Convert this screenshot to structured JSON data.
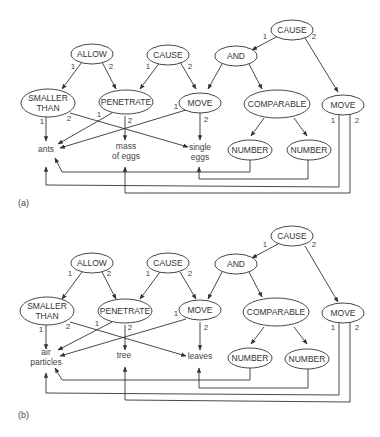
{
  "figure": {
    "panels": [
      {
        "caption": "(a)",
        "nodes": {
          "allow": "ALLOW",
          "cause1": "CAUSE",
          "cause_top": "CAUSE",
          "and": "AND",
          "smaller_than_1": "SMALLER",
          "smaller_than_2": "THAN",
          "penetrate": "PENETRATE",
          "move1": "MOVE",
          "comparable": "COMPARABLE",
          "move2": "MOVE",
          "number1": "NUMBER",
          "number2": "NUMBER"
        },
        "leaves": {
          "leaf1_line1": "ants",
          "leaf1_line2": "",
          "leaf2_line1": "mass",
          "leaf2_line2": "of eggs",
          "leaf3_line1": "single",
          "leaf3_line2": "eggs"
        },
        "arg_labels": {
          "one": "1",
          "two": "2"
        }
      },
      {
        "caption": "(b)",
        "nodes": {
          "allow": "ALLOW",
          "cause1": "CAUSE",
          "cause_top": "CAUSE",
          "and": "AND",
          "smaller_than_1": "SMALLER",
          "smaller_than_2": "THAN",
          "penetrate": "PENETRATE",
          "move1": "MOVE",
          "comparable": "COMPARABLE",
          "move2": "MOVE",
          "number1": "NUMBER",
          "number2": "NUMBER"
        },
        "leaves": {
          "leaf1_line1": "air",
          "leaf1_line2": "particles",
          "leaf2_line1": "tree",
          "leaf2_line2": "",
          "leaf3_line1": "leaves",
          "leaf3_line2": ""
        },
        "arg_labels": {
          "one": "1",
          "two": "2"
        }
      }
    ],
    "colors": {
      "stroke": "#333333",
      "text": "#444444",
      "background": "#ffffff"
    }
  }
}
